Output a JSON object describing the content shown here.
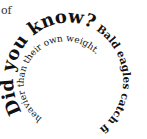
{
  "fragment": "of",
  "spiral": {
    "heading": "Did you know?",
    "fact_outer": " Bald eagles catch fish that are",
    "fact_inner": " heavier than their own weight."
  }
}
